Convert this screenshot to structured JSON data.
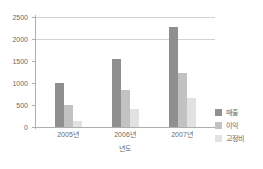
{
  "chart_data": {
    "type": "bar",
    "title": "",
    "subtitle": "",
    "xlabel": "년도",
    "ylabel": "",
    "categories": [
      "2005년",
      "2006년",
      "2007년"
    ],
    "series": [
      {
        "name": "매출",
        "color": "#8f8f8f",
        "values": [
          1000,
          1545,
          2270
        ]
      },
      {
        "name": "이익",
        "color": "#c2c2c2",
        "values": [
          490,
          840,
          1230
        ]
      },
      {
        "name": "고정비",
        "color": "#e2e2e2",
        "values": [
          130,
          400,
          670
        ]
      }
    ],
    "ylim": [
      0,
      2500
    ],
    "yticks": [
      0,
      500,
      1000,
      1500,
      2000,
      2500
    ],
    "ytick_labels": [
      "0",
      "500",
      "1000",
      "1500",
      "2000",
      "2500"
    ],
    "gridlines": [
      2000,
      2500
    ],
    "grid": true,
    "legend_position": "right-bottom"
  }
}
